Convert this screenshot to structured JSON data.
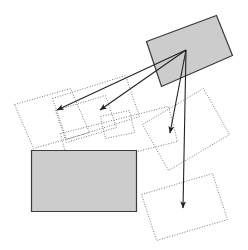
{
  "figure": {
    "title": "",
    "width": 248,
    "height": 250,
    "background_color": "#ffffff"
  },
  "style": {
    "dotted_stroke_color": "#6b6b6b",
    "dotted_stroke_width": 0.9,
    "dotted_dash_pattern": "1,1.6",
    "solid_stroke_color": "#3a3a3a",
    "solid_stroke_width": 1.2,
    "fill_gray": "#cccccc",
    "fill_none": "none",
    "arrow_color": "#222222",
    "arrow_stroke_width": 1.1
  },
  "shapes": [
    {
      "name": "dotted-rect-left",
      "kind": "dotted",
      "fill": "none",
      "points": "14.5,104.5 70.5,88.5 89.5,132.5 33.5,148.5"
    },
    {
      "name": "dotted-rect-left-upper",
      "kind": "dotted",
      "fill": "none",
      "points": "52.5,98.5 125.5,75.5 139.5,116.5 66.5,139.5"
    },
    {
      "name": "dotted-rect-center-upper",
      "kind": "dotted",
      "fill": "none",
      "points": "55.5,110.5 105.5,95.5 116.5,127.5 66.5,142.5"
    },
    {
      "name": "dotted-rect-center-small",
      "kind": "dotted",
      "fill": "none",
      "points": "100.5,116.5 129.5,110.5 134.5,132.5 105.5,138.5"
    },
    {
      "name": "dotted-rect-center-band",
      "kind": "dotted",
      "fill": "none",
      "points": "60.5,133.5 168.5,106.5 177.5,141.5 69.5,168.5"
    },
    {
      "name": "dotted-rect-right-large",
      "kind": "dotted",
      "fill": "none",
      "points": "142.5,124.5 203.5,88.5 229.5,134.5 168.5,170.5"
    },
    {
      "name": "dotted-rect-right-lower",
      "kind": "dotted",
      "fill": "none",
      "points": "141.5,194.5 212.5,173.5 227.5,219.5 156.5,240.5"
    },
    {
      "name": "gray-rect-top-right",
      "kind": "solid",
      "fill": "#cccccc",
      "points": "146.5,41.5 216.5,15.5 232.5,55.5 161.5,86.5"
    },
    {
      "name": "gray-rect-bottom-left",
      "kind": "solid",
      "fill": "#cccccc",
      "points": "31.5,150.5 136.5,150.5 136.5,211.5 31.5,211.5"
    }
  ],
  "arrows": [
    {
      "name": "arrow-to-left-far",
      "from_x": 186,
      "from_y": 50,
      "to_x": 57,
      "to_y": 110
    },
    {
      "name": "arrow-to-left-near",
      "from_x": 186,
      "from_y": 50,
      "to_x": 100,
      "to_y": 110
    },
    {
      "name": "arrow-to-down-short",
      "from_x": 186,
      "from_y": 50,
      "to_x": 170,
      "to_y": 133
    },
    {
      "name": "arrow-to-down-long",
      "from_x": 186,
      "from_y": 50,
      "to_x": 183,
      "to_y": 208
    }
  ],
  "convergence_point": {
    "name": "arrow-origin",
    "x": 186,
    "y": 50
  }
}
